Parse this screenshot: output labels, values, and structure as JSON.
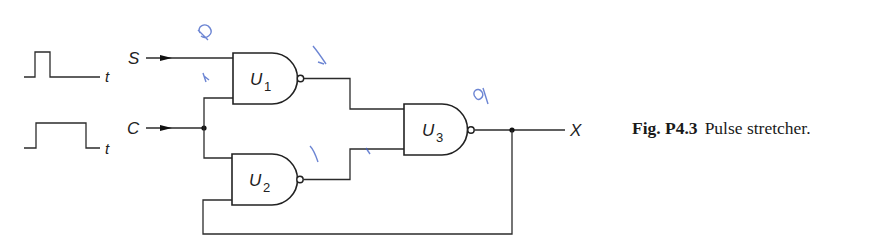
{
  "figure": {
    "caption_label": "Fig. P4.3",
    "caption_text": "Pulse stretcher."
  },
  "inputs": {
    "s_label": "S",
    "c_label": "C",
    "output_label": "X"
  },
  "waveforms": [
    {
      "name": "S",
      "axis_label": "t",
      "pulse": "narrow"
    },
    {
      "name": "C",
      "axis_label": "t",
      "pulse": "wide"
    }
  ],
  "gates": [
    {
      "id": "U1",
      "letter": "U",
      "index": "1",
      "type": "NAND"
    },
    {
      "id": "U2",
      "letter": "U",
      "index": "2",
      "type": "NAND"
    },
    {
      "id": "U3",
      "letter": "U",
      "index": "3",
      "type": "NAND"
    }
  ],
  "colors": {
    "ink": "#222222",
    "annotation": "#3b5cc4"
  }
}
